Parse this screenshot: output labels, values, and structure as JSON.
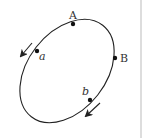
{
  "diagram": {
    "type": "orbit",
    "points": {
      "A": {
        "label": "A",
        "style": "upright"
      },
      "B": {
        "label": "B",
        "style": "upright"
      },
      "a": {
        "label": "a",
        "style": "italic"
      },
      "b": {
        "label": "b",
        "style": "italic"
      }
    },
    "arrows": [
      {
        "name": "arrow-near-a",
        "direction": "down-left"
      },
      {
        "name": "arrow-near-b",
        "direction": "down-left"
      }
    ],
    "colors": {
      "stroke": "#222222",
      "divider": "#bbbbbb"
    }
  }
}
